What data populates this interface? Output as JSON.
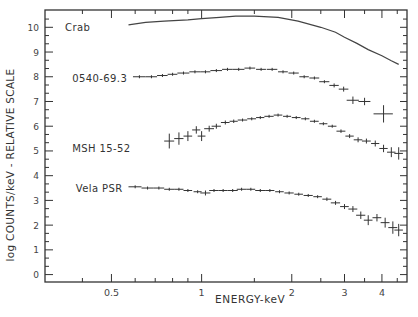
{
  "chart_data": {
    "type": "scatter",
    "title": "",
    "xlabel": "ENERGY-keV",
    "ylabel": "log COUNTS/keV - RELATIVE SCALE",
    "xscale": "log",
    "xlim": [
      0.3,
      4.85
    ],
    "ylim": [
      -0.3,
      10.7
    ],
    "grid": false,
    "legend": "inline labels at left of each spectrum",
    "x_ticks": [
      {
        "value": 0.5,
        "label": "0.5"
      },
      {
        "value": 1,
        "label": "1"
      },
      {
        "value": 2,
        "label": "2"
      },
      {
        "value": 3,
        "label": "3"
      },
      {
        "value": 4,
        "label": "4"
      }
    ],
    "x_minor_ticks": [
      0.3,
      0.4,
      0.6,
      0.7,
      0.8,
      0.9,
      1.5,
      2.5,
      3.5,
      4.5
    ],
    "y_ticks": [
      0,
      1,
      2,
      3,
      4,
      5,
      6,
      7,
      8,
      9,
      10
    ],
    "series": [
      {
        "name": "Crab",
        "style": "line",
        "label_pos": [
          0.35,
          10.0
        ],
        "x": [
          0.57,
          0.65,
          0.75,
          0.9,
          1.0,
          1.15,
          1.3,
          1.5,
          1.8,
          2.1,
          2.5,
          2.8,
          3.0,
          3.3,
          3.6,
          4.0,
          4.3,
          4.55
        ],
        "y": [
          10.1,
          10.2,
          10.25,
          10.3,
          10.35,
          10.4,
          10.45,
          10.45,
          10.4,
          10.25,
          10.0,
          9.8,
          9.6,
          9.35,
          9.1,
          8.85,
          8.65,
          8.5
        ]
      },
      {
        "name": "0540-69.3",
        "style": "crosses",
        "label_pos": [
          0.37,
          7.95
        ],
        "x": [
          0.62,
          0.68,
          0.74,
          0.8,
          0.87,
          0.95,
          1.03,
          1.12,
          1.22,
          1.33,
          1.45,
          1.58,
          1.72,
          1.87,
          2.03,
          2.2,
          2.38,
          2.57,
          2.77,
          2.98,
          3.2,
          3.5,
          4.05
        ],
        "y": [
          8.0,
          8.0,
          8.05,
          8.1,
          8.15,
          8.2,
          8.2,
          8.25,
          8.3,
          8.3,
          8.35,
          8.3,
          8.3,
          8.2,
          8.15,
          8.0,
          7.95,
          7.8,
          7.65,
          7.5,
          7.05,
          7.0,
          6.5
        ],
        "yerr": [
          0.05,
          0.05,
          0.05,
          0.05,
          0.05,
          0.05,
          0.05,
          0.05,
          0.05,
          0.05,
          0.05,
          0.05,
          0.05,
          0.05,
          0.05,
          0.05,
          0.06,
          0.06,
          0.08,
          0.1,
          0.15,
          0.15,
          0.35
        ],
        "xerr": [
          0.03,
          0.03,
          0.03,
          0.03,
          0.04,
          0.04,
          0.04,
          0.05,
          0.05,
          0.06,
          0.06,
          0.06,
          0.07,
          0.07,
          0.08,
          0.08,
          0.09,
          0.1,
          0.1,
          0.11,
          0.15,
          0.16,
          0.3
        ]
      },
      {
        "name": "MSH 15-52",
        "style": "crosses",
        "label_pos": [
          0.37,
          5.1
        ],
        "x": [
          0.78,
          0.84,
          0.9,
          0.96,
          1.0,
          1.06,
          1.12,
          1.2,
          1.28,
          1.37,
          1.47,
          1.57,
          1.68,
          1.8,
          1.93,
          2.07,
          2.22,
          2.38,
          2.55,
          2.73,
          2.92,
          3.12,
          3.33,
          3.55,
          3.8,
          4.05,
          4.3,
          4.55
        ],
        "y": [
          5.4,
          5.5,
          5.6,
          5.85,
          5.6,
          5.9,
          6.0,
          6.15,
          6.2,
          6.25,
          6.3,
          6.35,
          6.4,
          6.45,
          6.4,
          6.35,
          6.3,
          6.2,
          6.1,
          6.0,
          5.8,
          5.6,
          5.45,
          5.4,
          5.3,
          5.1,
          4.95,
          4.9
        ],
        "yerr": [
          0.3,
          0.25,
          0.2,
          0.15,
          0.2,
          0.12,
          0.1,
          0.08,
          0.07,
          0.06,
          0.06,
          0.05,
          0.05,
          0.05,
          0.05,
          0.05,
          0.05,
          0.05,
          0.06,
          0.06,
          0.07,
          0.08,
          0.1,
          0.1,
          0.12,
          0.15,
          0.2,
          0.25
        ],
        "xerr": [
          0.03,
          0.03,
          0.03,
          0.03,
          0.03,
          0.04,
          0.04,
          0.04,
          0.04,
          0.05,
          0.05,
          0.05,
          0.06,
          0.06,
          0.06,
          0.07,
          0.07,
          0.08,
          0.08,
          0.09,
          0.1,
          0.1,
          0.11,
          0.12,
          0.12,
          0.13,
          0.14,
          0.15
        ]
      },
      {
        "name": "Vela PSR",
        "style": "crosses",
        "label_pos": [
          0.38,
          3.5
        ],
        "x": [
          0.6,
          0.66,
          0.72,
          0.78,
          0.84,
          0.9,
          0.97,
          1.03,
          1.1,
          1.18,
          1.27,
          1.36,
          1.46,
          1.57,
          1.69,
          1.82,
          1.96,
          2.11,
          2.27,
          2.44,
          2.62,
          2.8,
          3.0,
          3.2,
          3.4,
          3.6,
          3.85,
          4.1,
          4.35,
          4.55
        ],
        "y": [
          3.55,
          3.5,
          3.5,
          3.45,
          3.45,
          3.4,
          3.35,
          3.3,
          3.4,
          3.4,
          3.4,
          3.45,
          3.45,
          3.4,
          3.4,
          3.35,
          3.3,
          3.25,
          3.2,
          3.15,
          3.05,
          2.9,
          2.75,
          2.65,
          2.4,
          2.2,
          2.3,
          2.1,
          1.9,
          1.8
        ],
        "yerr": [
          0.05,
          0.05,
          0.05,
          0.05,
          0.05,
          0.05,
          0.06,
          0.1,
          0.05,
          0.05,
          0.05,
          0.05,
          0.05,
          0.05,
          0.05,
          0.05,
          0.05,
          0.05,
          0.06,
          0.06,
          0.07,
          0.08,
          0.1,
          0.12,
          0.15,
          0.2,
          0.15,
          0.2,
          0.25,
          0.25
        ],
        "xerr": [
          0.03,
          0.03,
          0.03,
          0.03,
          0.03,
          0.03,
          0.03,
          0.04,
          0.04,
          0.04,
          0.05,
          0.05,
          0.05,
          0.06,
          0.06,
          0.06,
          0.07,
          0.07,
          0.08,
          0.08,
          0.09,
          0.1,
          0.1,
          0.11,
          0.12,
          0.12,
          0.13,
          0.14,
          0.15,
          0.15
        ]
      }
    ]
  }
}
